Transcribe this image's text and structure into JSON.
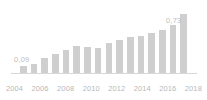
{
  "chart_data": {
    "type": "bar",
    "title": "",
    "subtitle": "",
    "xlabel": "",
    "ylabel": "",
    "grid": false,
    "legend": "none",
    "ylim": [
      0,
      0.8
    ],
    "categories": [
      "2003",
      "2004",
      "2005",
      "2006",
      "2007",
      "2008",
      "2009",
      "2010",
      "2011",
      "2012",
      "2013",
      "2014",
      "2015",
      "2016",
      "2017",
      "2018"
    ],
    "values": [
      0.09,
      0.11,
      0.18,
      0.23,
      0.28,
      0.33,
      0.32,
      0.31,
      0.37,
      0.41,
      0.44,
      0.46,
      0.49,
      0.53,
      0.59,
      0.73
    ],
    "x_tick_labels": [
      "2004",
      "2006",
      "2008",
      "2010",
      "2012",
      "2014",
      "2016",
      "2018"
    ],
    "data_labels": [
      {
        "category": "2003",
        "text": "0,09"
      },
      {
        "category": "2018",
        "text": "0,73"
      }
    ],
    "colors": {
      "bar": "#cfcfcf",
      "axis": "#d8d8d8",
      "label_text": "#bdbdbd",
      "tick_text": "#b8b8b8",
      "background": "#ffffff"
    }
  }
}
